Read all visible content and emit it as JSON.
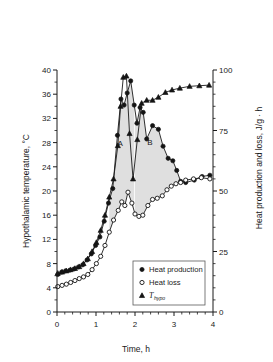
{
  "chart_data": {
    "type": "line",
    "title": "",
    "xlabel": "Time, h",
    "ylabel": "Hypothalamic temperature, °C",
    "y2label": "Heat production and loss, J/g · h",
    "xlim": [
      0,
      4
    ],
    "ylim": [
      0,
      40
    ],
    "y2lim": [
      0,
      100
    ],
    "xticks": [
      0,
      1,
      2,
      3,
      4
    ],
    "xticklabels": [
      "0",
      "1",
      "2",
      "3",
      "4"
    ],
    "yticks": [
      0,
      4,
      8,
      12,
      16,
      20,
      24,
      28,
      32,
      36,
      40
    ],
    "yticklabels": [
      "0",
      "4",
      "8",
      "12",
      "16",
      "20",
      "24",
      "28",
      "32",
      "36",
      "40"
    ],
    "y2ticks": [
      0,
      25,
      50,
      75,
      100
    ],
    "y2ticklabels": [
      "0",
      "25",
      "50",
      "75",
      "100"
    ],
    "grid": false,
    "legend_position": "lower-center-right",
    "annotations": [
      {
        "label": "A",
        "x": 1.62,
        "y": 27.4,
        "description": "shaded area between heat production and heat loss, first peak"
      },
      {
        "label": "B",
        "x": 2.38,
        "y": 27.6,
        "description": "shaded area between heat production and heat loss, second peak"
      }
    ],
    "series": [
      {
        "name": "Heat production",
        "marker": "filled-circle",
        "axis": "right",
        "units": "J/g · h",
        "points": [
          {
            "x": 0.02,
            "y": 15.5
          },
          {
            "x": 0.12,
            "y": 16.5
          },
          {
            "x": 0.22,
            "y": 17.0
          },
          {
            "x": 0.33,
            "y": 17.3
          },
          {
            "x": 0.44,
            "y": 17.8
          },
          {
            "x": 0.55,
            "y": 18.6
          },
          {
            "x": 0.66,
            "y": 19.5
          },
          {
            "x": 0.77,
            "y": 21.5
          },
          {
            "x": 0.88,
            "y": 24.0
          },
          {
            "x": 0.99,
            "y": 27.5
          },
          {
            "x": 1.1,
            "y": 31.0
          },
          {
            "x": 1.21,
            "y": 37.5
          },
          {
            "x": 1.32,
            "y": 45.0
          },
          {
            "x": 1.43,
            "y": 51.0
          },
          {
            "x": 1.55,
            "y": 73.0
          },
          {
            "x": 1.64,
            "y": 88.0
          },
          {
            "x": 1.72,
            "y": 85.5
          },
          {
            "x": 1.8,
            "y": 90.5
          },
          {
            "x": 1.89,
            "y": 95.5
          },
          {
            "x": 1.98,
            "y": 85.5
          },
          {
            "x": 2.05,
            "y": 78.0
          },
          {
            "x": 2.13,
            "y": 84.5
          },
          {
            "x": 2.21,
            "y": 82.5
          },
          {
            "x": 2.3,
            "y": 71.5
          },
          {
            "x": 2.45,
            "y": 77.0
          },
          {
            "x": 2.6,
            "y": 75.5
          },
          {
            "x": 2.72,
            "y": 68.5
          },
          {
            "x": 2.85,
            "y": 63.5
          },
          {
            "x": 2.97,
            "y": 62.5
          },
          {
            "x": 3.07,
            "y": 58.5
          },
          {
            "x": 3.17,
            "y": 54.0
          },
          {
            "x": 3.3,
            "y": 53.5
          },
          {
            "x": 3.52,
            "y": 54.5
          },
          {
            "x": 3.72,
            "y": 56.0
          },
          {
            "x": 3.92,
            "y": 56.5
          }
        ]
      },
      {
        "name": "Heat loss",
        "marker": "open-circle",
        "axis": "right",
        "units": "J/g · h",
        "points": [
          {
            "x": 0.02,
            "y": 10.5
          },
          {
            "x": 0.13,
            "y": 11.0
          },
          {
            "x": 0.24,
            "y": 11.5
          },
          {
            "x": 0.35,
            "y": 12.2
          },
          {
            "x": 0.46,
            "y": 13.0
          },
          {
            "x": 0.57,
            "y": 13.8
          },
          {
            "x": 0.68,
            "y": 14.5
          },
          {
            "x": 0.79,
            "y": 15.5
          },
          {
            "x": 0.9,
            "y": 17.5
          },
          {
            "x": 1.01,
            "y": 20.0
          },
          {
            "x": 1.12,
            "y": 23.0
          },
          {
            "x": 1.23,
            "y": 27.5
          },
          {
            "x": 1.34,
            "y": 33.0
          },
          {
            "x": 1.45,
            "y": 38.0
          },
          {
            "x": 1.57,
            "y": 42.0
          },
          {
            "x": 1.66,
            "y": 45.5
          },
          {
            "x": 1.74,
            "y": 44.0
          },
          {
            "x": 1.82,
            "y": 49.5
          },
          {
            "x": 1.92,
            "y": 45.0
          },
          {
            "x": 2.0,
            "y": 40.5
          },
          {
            "x": 2.1,
            "y": 39.5
          },
          {
            "x": 2.2,
            "y": 40.0
          },
          {
            "x": 2.33,
            "y": 44.0
          },
          {
            "x": 2.45,
            "y": 46.5
          },
          {
            "x": 2.57,
            "y": 47.0
          },
          {
            "x": 2.7,
            "y": 48.0
          },
          {
            "x": 2.82,
            "y": 50.5
          },
          {
            "x": 2.93,
            "y": 52.0
          },
          {
            "x": 3.05,
            "y": 53.0
          },
          {
            "x": 3.17,
            "y": 53.5
          },
          {
            "x": 3.3,
            "y": 54.5
          },
          {
            "x": 3.5,
            "y": 55.0
          },
          {
            "x": 3.7,
            "y": 55.5
          },
          {
            "x": 3.92,
            "y": 55.0
          }
        ]
      },
      {
        "name": "T_hypo",
        "marker": "filled-triangle",
        "axis": "left",
        "units": "°C",
        "points": [
          {
            "x": 0.02,
            "y": 6.4
          },
          {
            "x": 0.13,
            "y": 6.6
          },
          {
            "x": 0.24,
            "y": 6.8
          },
          {
            "x": 0.35,
            "y": 7.0
          },
          {
            "x": 0.46,
            "y": 7.2
          },
          {
            "x": 0.57,
            "y": 7.5
          },
          {
            "x": 0.68,
            "y": 8.0
          },
          {
            "x": 0.79,
            "y": 8.8
          },
          {
            "x": 0.9,
            "y": 10.0
          },
          {
            "x": 1.01,
            "y": 11.5
          },
          {
            "x": 1.12,
            "y": 13.5
          },
          {
            "x": 1.23,
            "y": 16.0
          },
          {
            "x": 1.34,
            "y": 19.0
          },
          {
            "x": 1.45,
            "y": 22.0
          },
          {
            "x": 1.56,
            "y": 27.5
          },
          {
            "x": 1.63,
            "y": 34.0
          },
          {
            "x": 1.7,
            "y": 38.8
          },
          {
            "x": 1.78,
            "y": 39.0
          },
          {
            "x": 1.86,
            "y": 29.5
          },
          {
            "x": 1.95,
            "y": 22.0
          },
          {
            "x": 2.06,
            "y": 28.5
          },
          {
            "x": 2.17,
            "y": 34.5
          },
          {
            "x": 2.3,
            "y": 35.0
          },
          {
            "x": 2.45,
            "y": 35.0
          },
          {
            "x": 2.6,
            "y": 35.5
          },
          {
            "x": 2.78,
            "y": 36.3
          },
          {
            "x": 2.95,
            "y": 36.7
          },
          {
            "x": 3.15,
            "y": 37.0
          },
          {
            "x": 3.4,
            "y": 37.3
          },
          {
            "x": 3.65,
            "y": 37.4
          },
          {
            "x": 3.9,
            "y": 37.5
          }
        ]
      }
    ]
  },
  "legend": {
    "items": [
      {
        "label": "Heat production",
        "marker": "filled-circle"
      },
      {
        "label": "Heat loss",
        "marker": "open-circle"
      },
      {
        "label": "T",
        "sublabel": "hypo",
        "marker": "filled-triangle"
      }
    ]
  }
}
